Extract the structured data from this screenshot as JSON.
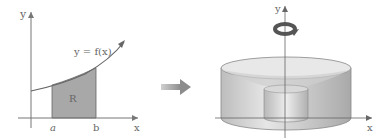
{
  "left_figure": {
    "y_axis_label": "y",
    "x_axis_label": "x",
    "curve_label": "y = f(x)",
    "region_label": "R",
    "tick_a": "a",
    "tick_b": "b"
  },
  "arrow": {
    "direction": "right"
  },
  "right_figure": {
    "y_axis_label": "y",
    "x_axis_label": "x",
    "rotation_icon": "rotate-around-y-axis"
  },
  "colors": {
    "axis": "#777777",
    "region_fill": "#a8a8a8",
    "arrow": "#999999",
    "solid_light": "#d9d9d9",
    "solid_dark": "#b0b0b0"
  }
}
